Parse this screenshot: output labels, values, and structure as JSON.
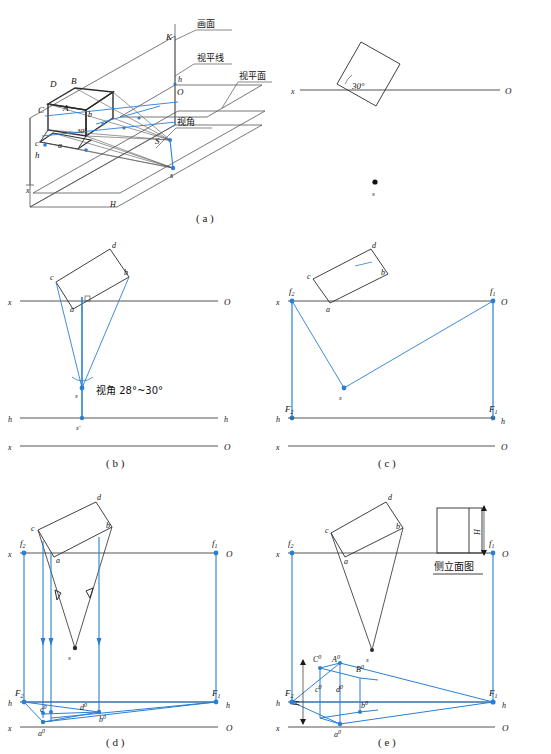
{
  "figure": {
    "title_note": "透视图作图步骤 (perspective drawing construction steps)",
    "panel_captions": {
      "a": "( a )",
      "b": "( b )",
      "c": "( c )",
      "d": "( d )",
      "e": "( e )"
    },
    "chinese_labels": {
      "picture_plane": "画面",
      "horizon_line": "视平线",
      "horizontal_vision_plane": "视平面",
      "view_angle": "视角",
      "side_elevation": "侧立面图",
      "view_angle_range": "视角 28°~30°"
    },
    "angles": {
      "plan_rotation": "30°",
      "pictorial_rotation": "30°"
    },
    "panel_a": {
      "axis_labels": {
        "x": "x",
        "O": "O",
        "K": "K",
        "h_left": "h",
        "h_right": "h"
      },
      "object_vertices_upper": [
        "D",
        "B",
        "C",
        "A"
      ],
      "object_vertices_lower": [
        "c",
        "a",
        "b"
      ],
      "station_point_space": "S",
      "station_point_plan": "s",
      "ground_mark": "H",
      "plan_view": {
        "axis_left": "x",
        "axis_right": "O",
        "angle": "30°",
        "station_point": "s"
      }
    },
    "panel_b": {
      "rect_vertices": [
        "c",
        "d",
        "a",
        "b"
      ],
      "axis_top": {
        "left": "x",
        "right": "O"
      },
      "horizon": {
        "left": "h",
        "right": "h"
      },
      "axis_bottom": {
        "left": "x",
        "right": "O"
      },
      "station_point": "s",
      "station_point_elev": "s'",
      "note": "视角 28°~30°"
    },
    "panel_c": {
      "rect_vertices": [
        "c",
        "d",
        "a",
        "b"
      ],
      "axis_top": {
        "left": "x",
        "right": "O"
      },
      "horizon": {
        "left": "h",
        "right": "h"
      },
      "axis_bottom": {
        "left": "x",
        "right": "O"
      },
      "vanishing_plan": {
        "left": "f2",
        "right": "f1"
      },
      "vanishing_persp": {
        "left": "F2",
        "right": "F1"
      },
      "station_point": "s"
    },
    "panel_d": {
      "rect_vertices": [
        "c",
        "d",
        "a",
        "b"
      ],
      "axis_top": {
        "left": "x",
        "right": "O"
      },
      "horizon": {
        "left": "h",
        "right": "h"
      },
      "axis_bottom": {
        "left": "x",
        "right": "O"
      },
      "vanishing_plan": {
        "left": "f2",
        "right": "f1"
      },
      "vanishing_persp": {
        "left": "F2",
        "right": "F1"
      },
      "station_point": "s",
      "ground_points": [
        "a0",
        "b0",
        "c0",
        "d0"
      ]
    },
    "panel_e": {
      "rect_vertices": [
        "c",
        "d",
        "a",
        "b"
      ],
      "axis_top": {
        "left": "x",
        "right": "O"
      },
      "horizon": {
        "left": "h",
        "right": "h"
      },
      "axis_bottom": {
        "left": "x",
        "right": "O"
      },
      "vanishing_plan": {
        "left": "f2",
        "right": "f1"
      },
      "vanishing_persp": {
        "left": "F2",
        "right": "F1"
      },
      "station_point": "s",
      "ground_points": [
        "a0",
        "b0",
        "c0",
        "d0"
      ],
      "height_points": [
        "A0",
        "B0",
        "C0"
      ],
      "side_elevation_label": "侧立面图",
      "height_dim": "H",
      "height_dim_left": "H"
    },
    "colors": {
      "construction_blue": "#2a7fd4",
      "object_black": "#2b2b2b",
      "axis_gray": "#555555",
      "background": "#ffffff"
    }
  }
}
